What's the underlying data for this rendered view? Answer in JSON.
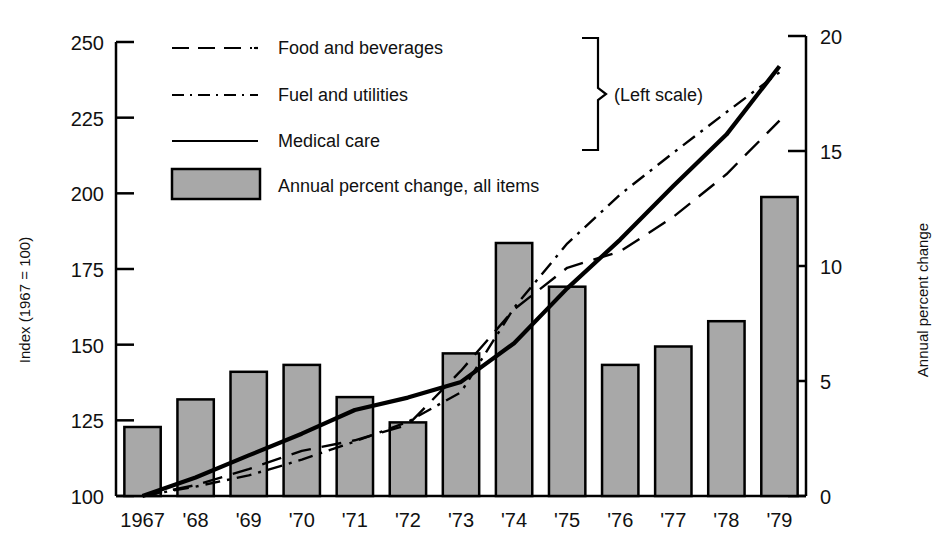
{
  "chart_data": {
    "type": "bar",
    "title": "",
    "subtitle": "",
    "xlabel": "",
    "ylabel": "Index (1967 = 100)",
    "y2label": "Annual percent change",
    "ylim": [
      100,
      250
    ],
    "y2lim": [
      0,
      20
    ],
    "ytick_labels": [
      "250",
      "225",
      "200",
      "175",
      "150",
      "125",
      "100"
    ],
    "ytick_values": [
      250,
      225,
      200,
      175,
      150,
      125,
      100
    ],
    "y2tick_labels": [
      "20",
      "15",
      "10",
      "5",
      "0"
    ],
    "y2tick_values": [
      20,
      15,
      10,
      5,
      0
    ],
    "grid": false,
    "legend_position": "top-left-inside",
    "categories": [
      "1967",
      "'68",
      "'69",
      "'70",
      "'71",
      "'72",
      "'73",
      "'74",
      "'75",
      "'76",
      "'77",
      "'78",
      "'79"
    ],
    "x": [
      1967,
      1968,
      1969,
      1970,
      1971,
      1972,
      1973,
      1974,
      1975,
      1976,
      1977,
      1978,
      1979
    ],
    "bar_series": {
      "name": "Annual percent change, all items",
      "axis": "right",
      "unit": "percent",
      "values": [
        3.0,
        4.2,
        5.4,
        5.7,
        4.3,
        3.2,
        6.2,
        11.0,
        9.1,
        5.7,
        6.5,
        7.6,
        13.0
      ],
      "fill": "#a8a8a8",
      "stroke": "#000000"
    },
    "series": [
      {
        "name": "Food and beverages",
        "axis": "left",
        "style": "dashed",
        "values": [
          100.0,
          103.6,
          108.9,
          114.9,
          118.4,
          123.5,
          141.4,
          161.7,
          175.4,
          180.8,
          192.2,
          206.3,
          224.0
        ]
      },
      {
        "name": "Fuel and utilities",
        "axis": "left",
        "style": "dash-dot",
        "values": [
          100.0,
          103.1,
          106.8,
          112.0,
          118.0,
          124.5,
          134.3,
          162.2,
          183.4,
          199.6,
          213.4,
          226.8,
          240.0
        ]
      },
      {
        "name": "Medical care",
        "axis": "left",
        "style": "solid",
        "values": [
          100.0,
          106.1,
          113.4,
          120.6,
          128.4,
          132.5,
          137.7,
          150.5,
          168.6,
          184.7,
          202.4,
          219.4,
          242.0
        ]
      }
    ],
    "annotations": [
      {
        "text": "(Left scale)",
        "role": "brace-label"
      }
    ]
  },
  "legend": {
    "items": [
      {
        "label": "Food and beverages",
        "style": "dashed"
      },
      {
        "label": "Fuel and utilities",
        "style": "dash-dot"
      },
      {
        "label": "Medical care",
        "style": "solid"
      },
      {
        "label": "Annual percent change, all items",
        "style": "swatch"
      }
    ],
    "brace_label": "(Left scale)"
  },
  "axes": {
    "left": {
      "title": "Index (1967 = 100)",
      "ticks": [
        "250",
        "225",
        "200",
        "175",
        "150",
        "125",
        "100"
      ]
    },
    "right": {
      "title": "Annual percent change",
      "ticks": [
        "20",
        "15",
        "10",
        "5",
        "0"
      ]
    },
    "bottom": {
      "ticks": [
        "1967",
        "'68",
        "'69",
        "'70",
        "'71",
        "'72",
        "'73",
        "'74",
        "'75",
        "'76",
        "'77",
        "'78",
        "'79"
      ]
    }
  },
  "colors": {
    "ink": "#000000",
    "bar_fill": "#a8a8a8",
    "bar_stroke": "#000000",
    "background": "#ffffff"
  }
}
